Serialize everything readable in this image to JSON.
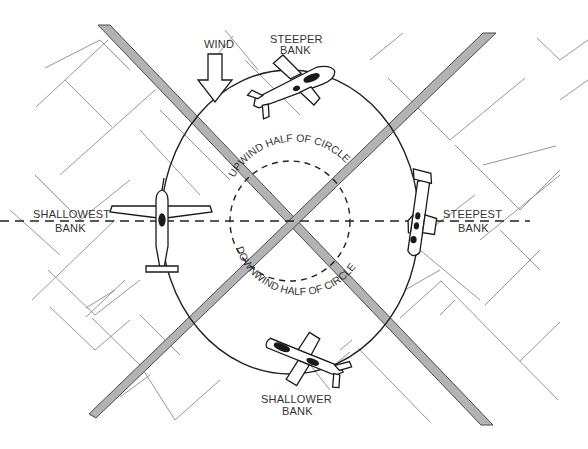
{
  "diagram": {
    "wind": {
      "label": "WIND",
      "direction": "down",
      "icon": "down-arrow-icon"
    },
    "labels": {
      "top": [
        "STEEPER",
        "BANK"
      ],
      "left": [
        "SHALLOWEST",
        "BANK"
      ],
      "right": [
        "STEEPEST",
        "BANK"
      ],
      "bottom": [
        "SHALLOWER",
        "BANK"
      ]
    },
    "arc_labels": {
      "upwind": "UPWIND HALF OF CIRCLE",
      "downwind": "DOWNWIND HALF OF CIRCLE"
    },
    "colors": {
      "road_fill": "#b3b3b3",
      "road_stroke": "#4a4a4a",
      "grid": "#8a8a8a",
      "circle": "#222222",
      "ink": "#1a1a1a",
      "background": "#ffffff"
    },
    "geometry": {
      "circle_center": [
        290,
        220
      ],
      "outer_circle_radius": [
        128,
        152
      ],
      "inner_dashed_radius": 60,
      "aircraft_positions": [
        "top",
        "left",
        "right",
        "bottom"
      ]
    }
  }
}
